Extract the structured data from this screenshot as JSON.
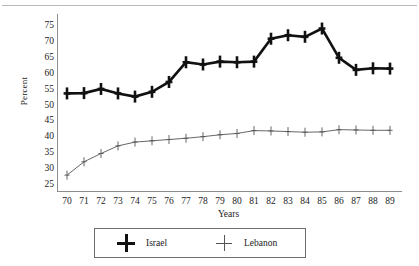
{
  "chart_data": {
    "type": "line",
    "title": "",
    "xlabel": "Years",
    "ylabel": "Percent",
    "grid": false,
    "legend_position": "bottom",
    "xlim": [
      70,
      89
    ],
    "ylim": [
      25,
      75
    ],
    "ytick_labels": [
      "75",
      "70",
      "65",
      "60",
      "55",
      "50",
      "45",
      "40",
      "35",
      "30",
      "25"
    ],
    "ytick_values": [
      75,
      70,
      65,
      60,
      55,
      50,
      45,
      40,
      35,
      30,
      25
    ],
    "categories": [
      "70",
      "71",
      "72",
      "73",
      "74",
      "75",
      "76",
      "77",
      "78",
      "79",
      "80",
      "81",
      "82",
      "83",
      "84",
      "85",
      "86",
      "87",
      "88",
      "89"
    ],
    "x": [
      70,
      71,
      72,
      73,
      74,
      75,
      76,
      77,
      78,
      79,
      80,
      81,
      82,
      83,
      84,
      85,
      86,
      87,
      88,
      89
    ],
    "series": [
      {
        "name": "Israel",
        "marker": "plus-bold",
        "color": "#111111",
        "line_width": 2.6,
        "values": [
          53.8,
          53.9,
          55.2,
          53.8,
          52.8,
          54.3,
          57.4,
          63.6,
          62.9,
          63.8,
          63.6,
          63.8,
          71.0,
          72.1,
          71.6,
          74.2,
          65.0,
          61.2,
          61.7,
          61.6
        ]
      },
      {
        "name": "Lebanon",
        "marker": "plus-thin",
        "color": "#555555",
        "line_width": 0.9,
        "values": [
          28.1,
          32.3,
          34.9,
          37.3,
          38.5,
          38.9,
          39.3,
          39.7,
          40.2,
          40.8,
          41.2,
          42.1,
          42.0,
          41.8,
          41.6,
          41.7,
          42.4,
          42.3,
          42.2,
          42.2
        ]
      }
    ]
  },
  "legend": {
    "entries": [
      {
        "label": "Israel",
        "marker": "plus-bold-icon"
      },
      {
        "label": "Lebanon",
        "marker": "plus-thin-icon"
      }
    ]
  }
}
